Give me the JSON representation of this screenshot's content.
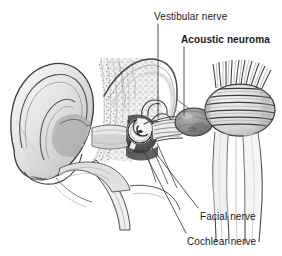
{
  "figure": {
    "kind": "anatomical-illustration",
    "style": "grayscale pencil / engraving",
    "width": 282,
    "height": 256,
    "background_color": "#ffffff",
    "ink_color": "#1a1a1a"
  },
  "labels": {
    "vestibular_nerve": "Vestibular nerve",
    "acoustic_neuroma": "Acoustic neuroma",
    "facial_nerve": "Facial nerve",
    "cochlear_nerve": "Cochlear nerve"
  },
  "anatomy": {
    "pinna": "outer ear (auricle)",
    "ear_canal": "external auditory canal",
    "eardrum": "tympanic membrane",
    "ossicles": "middle ear ossicles",
    "cochlea": "cochlea",
    "semicircular_canals": "semicircular canals",
    "internal_auditory_canal": "internal auditory canal",
    "tumor": "acoustic neuroma mass",
    "brainstem": "brainstem",
    "eustachian_tube": "eustachian tube",
    "temporal_bone": "temporal bone"
  }
}
